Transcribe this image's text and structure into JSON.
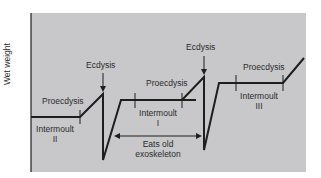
{
  "diagram": {
    "y_axis_label": "Wet weight",
    "labels": {
      "ecdysis_1": "Ecdysis",
      "ecdysis_2": "Ecdysis",
      "proecdysis_1": "Proecdysis",
      "proecdysis_2": "Proecdysis",
      "proecdysis_3": "Proecdysis",
      "intermoult_2_line1": "Intermoult",
      "intermoult_2_line2": "II",
      "intermoult_1_line1": "Intermoult",
      "intermoult_1_line2": "I",
      "intermoult_3_line1": "Intermoult",
      "intermoult_3_line2": "III",
      "eats_line1": "Eats old",
      "eats_line2": "exoskeleton"
    },
    "colors": {
      "panel": "#c8c8ca",
      "line": "#1e1e1e",
      "text": "#2a2a2a"
    }
  }
}
